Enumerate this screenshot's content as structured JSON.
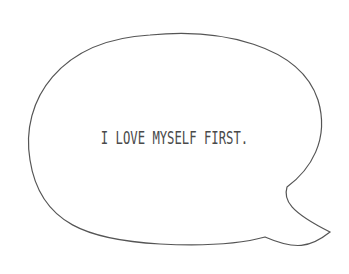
{
  "bubble": {
    "text": "I LOVE MYSELF FIRST.",
    "stroke_color": "#555555",
    "text_color": "#4a4a4a"
  }
}
